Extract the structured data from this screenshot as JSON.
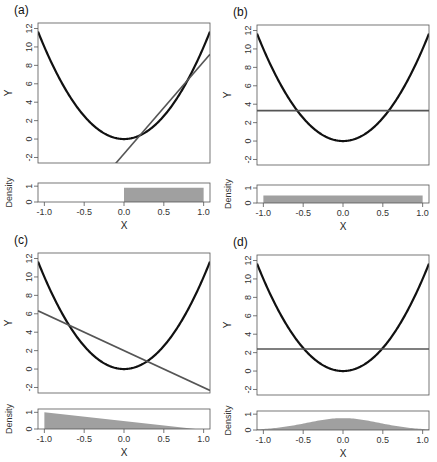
{
  "figure": {
    "y_label": "Y",
    "x_label": "X",
    "density_label": "Density",
    "x_ticks": [
      "-1.0",
      "-0.5",
      "0.0",
      "0.5",
      "1.0"
    ],
    "y_ticks": [
      "-2",
      "0",
      "2",
      "4",
      "6",
      "8",
      "10",
      "12"
    ],
    "density_ticks": [
      "0",
      "1"
    ]
  },
  "panels": [
    {
      "label": "(a)"
    },
    {
      "label": "(b)"
    },
    {
      "label": "(c)"
    },
    {
      "label": "(d)"
    }
  ],
  "chart_data": [
    {
      "type": "line",
      "title": "(a)",
      "xlabel": "X",
      "ylabel": "Y",
      "xlim": [
        -1.08,
        1.08
      ],
      "ylim": [
        -2.6,
        12.6
      ],
      "series": [
        {
          "name": "curve",
          "function": "y = 10x^2",
          "color": "#111111"
        },
        {
          "name": "linear fit",
          "slope": 10,
          "intercept": -1.6,
          "color": "#555555"
        }
      ],
      "density": {
        "ylabel": "Density",
        "ylim": [
          0,
          1.2
        ],
        "shape": "uniform",
        "support": [
          0,
          1
        ],
        "height": 0.9,
        "color": "#a0a0a0"
      }
    },
    {
      "type": "line",
      "title": "(b)",
      "xlabel": "X",
      "ylabel": "Y",
      "xlim": [
        -1.08,
        1.08
      ],
      "ylim": [
        -2.6,
        12.6
      ],
      "series": [
        {
          "name": "curve",
          "function": "y = 10x^2",
          "color": "#111111"
        },
        {
          "name": "linear fit",
          "slope": 0,
          "intercept": 3.3,
          "color": "#555555"
        }
      ],
      "density": {
        "ylabel": "Density",
        "ylim": [
          0,
          1.2
        ],
        "shape": "uniform",
        "support": [
          -1,
          1
        ],
        "height": 0.5,
        "color": "#a0a0a0"
      }
    },
    {
      "type": "line",
      "title": "(c)",
      "xlabel": "X",
      "ylabel": "Y",
      "xlim": [
        -1.08,
        1.08
      ],
      "ylim": [
        -2.6,
        12.6
      ],
      "series": [
        {
          "name": "curve",
          "function": "y = 10x^2",
          "color": "#111111"
        },
        {
          "name": "linear fit",
          "slope": -4,
          "intercept": 2,
          "color": "#555555"
        }
      ],
      "density": {
        "ylabel": "Density",
        "ylim": [
          0,
          1.2
        ],
        "shape": "triangular-decreasing",
        "support": [
          -1,
          0.9
        ],
        "height": 1.0,
        "color": "#a0a0a0"
      }
    },
    {
      "type": "line",
      "title": "(d)",
      "xlabel": "X",
      "ylabel": "Y",
      "xlim": [
        -1.08,
        1.08
      ],
      "ylim": [
        -2.6,
        12.6
      ],
      "series": [
        {
          "name": "curve",
          "function": "y = 10x^2",
          "color": "#111111"
        },
        {
          "name": "linear fit",
          "slope": 0,
          "intercept": 2.4,
          "color": "#555555"
        }
      ],
      "density": {
        "ylabel": "Density",
        "ylim": [
          0,
          1.2
        ],
        "shape": "bell",
        "support": [
          -1.08,
          1.08
        ],
        "height": 0.75,
        "color": "#a0a0a0"
      }
    }
  ]
}
